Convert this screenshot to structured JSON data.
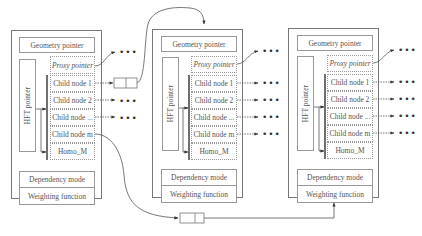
{
  "nodes": [
    {
      "geometry_pointer": "Geometry pointer",
      "proxy_pointer": "Proxy pointer",
      "hft_pointer": "HFT pointer",
      "children": [
        "Child node  1",
        "Child node  2",
        "Child node ...",
        "Child node  m"
      ],
      "homo": "Homo_M",
      "dependency_mode": "Dependency mode",
      "weighting_function": "Weighting function"
    },
    {
      "geometry_pointer": "Geometry pointer",
      "proxy_pointer": "Proxy pointer",
      "hft_pointer": "HFT pointer",
      "children": [
        "Child node  1",
        "Child node  2",
        "Child node ...",
        "Child node  m"
      ],
      "homo": "Homo_M",
      "dependency_mode": "Dependency mode",
      "weighting_function": "Weighting function"
    },
    {
      "geometry_pointer": "Geometry pointer",
      "proxy_pointer": "Proxy pointer",
      "hft_pointer": "HFT pointer",
      "children": [
        "Child node  1",
        "Child node  2",
        "Child node ...",
        "Child node  m"
      ],
      "homo": "Homo_M",
      "dependency_mode": "Dependency mode",
      "weighting_function": "Weighting function"
    }
  ],
  "ellipsis": "•••"
}
